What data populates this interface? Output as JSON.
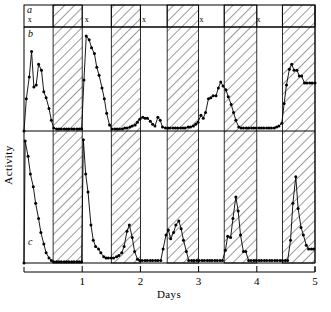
{
  "chart_data": {
    "type": "line",
    "title": "",
    "xlabel": "Days",
    "ylabel": "Activity",
    "xlim": [
      0,
      5
    ],
    "x_ticks": [
      1,
      2,
      3,
      4,
      5
    ],
    "x_tick_labels": [
      "1",
      "2",
      "3",
      "4",
      "5"
    ],
    "y_ticks_shown": false,
    "grid": false,
    "legend": false,
    "panels": [
      {
        "id": "a",
        "label": "a",
        "type": "light-dark-bar",
        "description": "Light/dark cycle bar: open (white) segments are light phase marked with x, hatched segments are dark phase",
        "marks": [
          {
            "symbol": "x",
            "x": 0.1
          },
          {
            "symbol": "x",
            "x": 1.08
          },
          {
            "symbol": "x",
            "x": 2.06
          },
          {
            "symbol": "x",
            "x": 3.05
          },
          {
            "symbol": "x",
            "x": 4.03
          }
        ]
      },
      {
        "id": "b",
        "label": "b",
        "type": "line",
        "description": "Activity record b, points connected by lines, baseline zero",
        "ylim": [
          0,
          1
        ],
        "points": [
          [
            0.0,
            0.0
          ],
          [
            0.04,
            0.33
          ],
          [
            0.09,
            0.55
          ],
          [
            0.13,
            0.81
          ],
          [
            0.17,
            0.45
          ],
          [
            0.21,
            0.47
          ],
          [
            0.25,
            0.68
          ],
          [
            0.3,
            0.62
          ],
          [
            0.34,
            0.4
          ],
          [
            0.38,
            0.34
          ],
          [
            0.43,
            0.23
          ],
          [
            0.47,
            0.11
          ],
          [
            0.51,
            0.03
          ],
          [
            0.56,
            0.02
          ],
          [
            0.6,
            0.02
          ],
          [
            0.64,
            0.02
          ],
          [
            0.69,
            0.02
          ],
          [
            0.73,
            0.02
          ],
          [
            0.77,
            0.02
          ],
          [
            0.82,
            0.02
          ],
          [
            0.86,
            0.02
          ],
          [
            0.91,
            0.02
          ],
          [
            0.95,
            0.02
          ],
          [
            0.99,
            0.02
          ],
          [
            1.03,
            0.52
          ],
          [
            1.07,
            0.97
          ],
          [
            1.12,
            0.93
          ],
          [
            1.16,
            0.85
          ],
          [
            1.21,
            0.79
          ],
          [
            1.25,
            0.65
          ],
          [
            1.29,
            0.57
          ],
          [
            1.34,
            0.44
          ],
          [
            1.38,
            0.33
          ],
          [
            1.42,
            0.18
          ],
          [
            1.47,
            0.06
          ],
          [
            1.51,
            0.02
          ],
          [
            1.56,
            0.02
          ],
          [
            1.6,
            0.02
          ],
          [
            1.64,
            0.02
          ],
          [
            1.69,
            0.02
          ],
          [
            1.73,
            0.03
          ],
          [
            1.77,
            0.03
          ],
          [
            1.82,
            0.04
          ],
          [
            1.86,
            0.05
          ],
          [
            1.91,
            0.06
          ],
          [
            1.95,
            0.09
          ],
          [
            1.99,
            0.12
          ],
          [
            2.04,
            0.14
          ],
          [
            2.08,
            0.13
          ],
          [
            2.12,
            0.13
          ],
          [
            2.17,
            0.1
          ],
          [
            2.21,
            0.07
          ],
          [
            2.25,
            0.05
          ],
          [
            2.3,
            0.14
          ],
          [
            2.34,
            0.11
          ],
          [
            2.38,
            0.04
          ],
          [
            2.43,
            0.03
          ],
          [
            2.47,
            0.03
          ],
          [
            2.51,
            0.03
          ],
          [
            2.56,
            0.03
          ],
          [
            2.6,
            0.03
          ],
          [
            2.64,
            0.03
          ],
          [
            2.69,
            0.03
          ],
          [
            2.73,
            0.03
          ],
          [
            2.77,
            0.03
          ],
          [
            2.82,
            0.04
          ],
          [
            2.86,
            0.04
          ],
          [
            2.91,
            0.05
          ],
          [
            2.95,
            0.07
          ],
          [
            2.99,
            0.09
          ],
          [
            3.04,
            0.16
          ],
          [
            3.08,
            0.13
          ],
          [
            3.12,
            0.19
          ],
          [
            3.17,
            0.33
          ],
          [
            3.21,
            0.34
          ],
          [
            3.25,
            0.36
          ],
          [
            3.3,
            0.36
          ],
          [
            3.34,
            0.44
          ],
          [
            3.38,
            0.5
          ],
          [
            3.42,
            0.46
          ],
          [
            3.47,
            0.42
          ],
          [
            3.51,
            0.35
          ],
          [
            3.56,
            0.27
          ],
          [
            3.6,
            0.19
          ],
          [
            3.64,
            0.11
          ],
          [
            3.69,
            0.04
          ],
          [
            3.73,
            0.03
          ],
          [
            3.77,
            0.03
          ],
          [
            3.82,
            0.03
          ],
          [
            3.86,
            0.03
          ],
          [
            3.91,
            0.03
          ],
          [
            3.95,
            0.03
          ],
          [
            3.99,
            0.03
          ],
          [
            4.04,
            0.03
          ],
          [
            4.08,
            0.03
          ],
          [
            4.12,
            0.03
          ],
          [
            4.17,
            0.03
          ],
          [
            4.21,
            0.03
          ],
          [
            4.25,
            0.03
          ],
          [
            4.3,
            0.03
          ],
          [
            4.34,
            0.04
          ],
          [
            4.38,
            0.05
          ],
          [
            4.43,
            0.08
          ],
          [
            4.47,
            0.28
          ],
          [
            4.51,
            0.47
          ],
          [
            4.56,
            0.63
          ],
          [
            4.6,
            0.68
          ],
          [
            4.64,
            0.62
          ],
          [
            4.69,
            0.62
          ],
          [
            4.73,
            0.56
          ],
          [
            4.77,
            0.56
          ],
          [
            4.82,
            0.49
          ],
          [
            4.86,
            0.49
          ],
          [
            4.91,
            0.49
          ],
          [
            4.95,
            0.49
          ],
          [
            5.0,
            0.49
          ]
        ]
      },
      {
        "id": "c",
        "label": "c",
        "type": "line",
        "description": "Activity record c, points connected by lines, baseline zero",
        "ylim": [
          0,
          1
        ],
        "points": [
          [
            0.0,
            0.0
          ],
          [
            0.02,
            0.96
          ],
          [
            0.07,
            0.84
          ],
          [
            0.11,
            0.7
          ],
          [
            0.16,
            0.6
          ],
          [
            0.2,
            0.47
          ],
          [
            0.25,
            0.35
          ],
          [
            0.29,
            0.24
          ],
          [
            0.34,
            0.15
          ],
          [
            0.38,
            0.08
          ],
          [
            0.43,
            0.04
          ],
          [
            0.47,
            0.02
          ],
          [
            0.51,
            0.01
          ],
          [
            0.56,
            0.01
          ],
          [
            0.6,
            0.01
          ],
          [
            0.64,
            0.01
          ],
          [
            0.69,
            0.01
          ],
          [
            0.73,
            0.01
          ],
          [
            0.77,
            0.01
          ],
          [
            0.82,
            0.01
          ],
          [
            0.86,
            0.01
          ],
          [
            0.91,
            0.01
          ],
          [
            0.95,
            0.01
          ],
          [
            0.99,
            0.01
          ],
          [
            1.02,
            0.97
          ],
          [
            1.06,
            0.7
          ],
          [
            1.1,
            0.56
          ],
          [
            1.15,
            0.3
          ],
          [
            1.19,
            0.18
          ],
          [
            1.23,
            0.13
          ],
          [
            1.28,
            0.11
          ],
          [
            1.32,
            0.08
          ],
          [
            1.37,
            0.05
          ],
          [
            1.41,
            0.04
          ],
          [
            1.45,
            0.04
          ],
          [
            1.5,
            0.04
          ],
          [
            1.54,
            0.04
          ],
          [
            1.59,
            0.05
          ],
          [
            1.63,
            0.06
          ],
          [
            1.68,
            0.08
          ],
          [
            1.72,
            0.13
          ],
          [
            1.77,
            0.25
          ],
          [
            1.81,
            0.3
          ],
          [
            1.86,
            0.2
          ],
          [
            1.9,
            0.09
          ],
          [
            1.95,
            0.03
          ],
          [
            1.99,
            0.02
          ],
          [
            2.03,
            0.02
          ],
          [
            2.08,
            0.02
          ],
          [
            2.12,
            0.02
          ],
          [
            2.17,
            0.02
          ],
          [
            2.21,
            0.02
          ],
          [
            2.26,
            0.02
          ],
          [
            2.3,
            0.02
          ],
          [
            2.35,
            0.02
          ],
          [
            2.39,
            0.11
          ],
          [
            2.44,
            0.22
          ],
          [
            2.48,
            0.26
          ],
          [
            2.52,
            0.19
          ],
          [
            2.57,
            0.24
          ],
          [
            2.61,
            0.3
          ],
          [
            2.66,
            0.33
          ],
          [
            2.7,
            0.27
          ],
          [
            2.74,
            0.18
          ],
          [
            2.79,
            0.09
          ],
          [
            2.83,
            0.02
          ],
          [
            2.88,
            0.02
          ],
          [
            2.92,
            0.02
          ],
          [
            2.97,
            0.02
          ],
          [
            3.01,
            0.02
          ],
          [
            3.06,
            0.02
          ],
          [
            3.1,
            0.02
          ],
          [
            3.15,
            0.02
          ],
          [
            3.19,
            0.02
          ],
          [
            3.23,
            0.02
          ],
          [
            3.28,
            0.02
          ],
          [
            3.32,
            0.02
          ],
          [
            3.37,
            0.02
          ],
          [
            3.41,
            0.02
          ],
          [
            3.46,
            0.1
          ],
          [
            3.5,
            0.21
          ],
          [
            3.55,
            0.2
          ],
          [
            3.59,
            0.35
          ],
          [
            3.64,
            0.52
          ],
          [
            3.68,
            0.41
          ],
          [
            3.72,
            0.22
          ],
          [
            3.77,
            0.09
          ],
          [
            3.81,
            0.09
          ],
          [
            3.86,
            0.02
          ],
          [
            3.9,
            0.02
          ],
          [
            3.95,
            0.02
          ],
          [
            3.99,
            0.02
          ],
          [
            4.04,
            0.02
          ],
          [
            4.08,
            0.02
          ],
          [
            4.13,
            0.02
          ],
          [
            4.17,
            0.02
          ],
          [
            4.22,
            0.02
          ],
          [
            4.26,
            0.02
          ],
          [
            4.31,
            0.02
          ],
          [
            4.35,
            0.02
          ],
          [
            4.4,
            0.02
          ],
          [
            4.44,
            0.02
          ],
          [
            4.49,
            0.02
          ],
          [
            4.53,
            0.02
          ],
          [
            4.58,
            0.18
          ],
          [
            4.62,
            0.47
          ],
          [
            4.67,
            0.68
          ],
          [
            4.71,
            0.43
          ],
          [
            4.76,
            0.28
          ],
          [
            4.8,
            0.22
          ],
          [
            4.85,
            0.14
          ],
          [
            4.89,
            0.11
          ],
          [
            4.94,
            0.11
          ],
          [
            4.98,
            0.11
          ]
        ]
      }
    ],
    "shading": {
      "description": "Hatched vertical bands denote dark phase of the light-dark cycle",
      "style": "diagonal-hatch",
      "bands": [
        {
          "start": 0.5,
          "end": 1.0
        },
        {
          "start": 1.5,
          "end": 2.0
        },
        {
          "start": 2.46,
          "end": 3.0
        },
        {
          "start": 3.44,
          "end": 4.0
        },
        {
          "start": 4.44,
          "end": 5.0
        }
      ]
    }
  },
  "axes": {
    "x_title": "Days",
    "y_title": "Activity",
    "tick_labels": [
      "1",
      "2",
      "3",
      "4",
      "5"
    ]
  },
  "panel_letters": {
    "a": "a",
    "b": "b",
    "c": "c"
  },
  "marks": {
    "x_symbol": "x"
  },
  "colors": {
    "ink": "#000000",
    "background": "#ffffff",
    "hatch": "#555555"
  }
}
